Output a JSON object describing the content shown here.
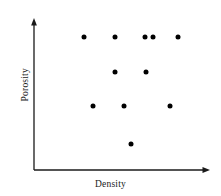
{
  "figure": {
    "width": 221,
    "height": 196,
    "background_color": "#ffffff",
    "ink_color": "#1a1a1a",
    "marker_color": "#000000"
  },
  "axes": {
    "x_axis": {
      "label": "Density",
      "origin_px": [
        34,
        170
      ],
      "end_px": [
        208,
        170
      ],
      "arrow": true,
      "ticks": [],
      "tick_labels": []
    },
    "y_axis": {
      "label": "Porosity",
      "origin_px": [
        34,
        170
      ],
      "end_px": [
        34,
        20
      ],
      "arrow": true,
      "ticks": [],
      "tick_labels": []
    }
  },
  "chart_data": {
    "type": "scatter",
    "title": "",
    "subtitle": "",
    "xlabel": "Density",
    "ylabel": "Porosity",
    "xlim": [
      0,
      10
    ],
    "ylim": [
      0,
      10
    ],
    "grid": false,
    "legend": null,
    "axis_ticks_shown": false,
    "marker": {
      "shape": "circle",
      "color": "#000000",
      "size_px": 5
    },
    "n_points": 11,
    "points_px": [
      [
        84,
        37
      ],
      [
        115,
        37
      ],
      [
        145,
        37
      ],
      [
        153,
        37
      ],
      [
        178,
        37
      ],
      [
        115,
        72
      ],
      [
        146,
        72
      ],
      [
        93,
        106
      ],
      [
        124,
        106
      ],
      [
        170,
        106
      ],
      [
        131,
        144
      ]
    ],
    "x": [
      2.9,
      4.7,
      6.4,
      6.8,
      8.3,
      4.7,
      6.4,
      3.4,
      5.2,
      7.8,
      5.6
    ],
    "y": [
      8.9,
      8.9,
      8.9,
      8.9,
      8.9,
      6.5,
      6.5,
      4.3,
      4.3,
      4.3,
      1.7
    ],
    "annotations": []
  }
}
